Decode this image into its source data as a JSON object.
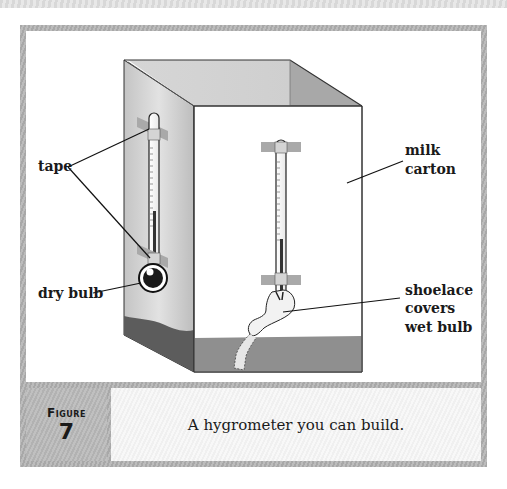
{
  "figure": {
    "label": "Figure",
    "number": "7",
    "caption": "A hygrometer you can build."
  },
  "labels": {
    "tape": "tape",
    "dry_bulb": "dry bulb",
    "milk_carton_line1": "milk",
    "milk_carton_line2": "carton",
    "shoelace_line1": "shoelace",
    "shoelace_line2": "covers",
    "shoelace_line3": "wet bulb"
  },
  "colors": {
    "frame": "#b0b0b0",
    "water": "#8c8c8c",
    "water_side": "#5a5a5a",
    "tape": "#a9a9a9",
    "mercury": "#333333"
  }
}
